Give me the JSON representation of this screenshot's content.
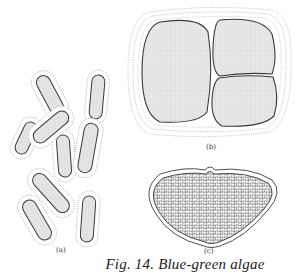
{
  "figure": {
    "caption": "Fig. 14.  Blue-green algae",
    "panels": [
      {
        "id": "a",
        "label": "(a)",
        "description": "Rod-shaped cells, each surrounded by a dotted gelatinous sheath"
      },
      {
        "id": "b",
        "label": "(b)",
        "description": "Colony of three cells within multiple concentric dotted sheaths"
      },
      {
        "id": "c",
        "label": "(c)",
        "description": "Bilobed colony packed with many small polygonal cells inside an outer sheath"
      }
    ],
    "colors": {
      "ink": "#3a3a3a",
      "stipple": "#b8b8b8",
      "sheath": "#8a8a8a",
      "background": "#ffffff"
    }
  }
}
